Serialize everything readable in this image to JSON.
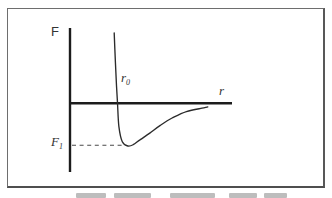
{
  "figure": {
    "y_axis_label": "F",
    "x_axis_label": "r",
    "equilibrium_label": "r",
    "equilibrium_label_sub": "0",
    "min_force_label": "F",
    "min_force_label_sub": "1"
  },
  "chart_data": {
    "type": "line",
    "title": "",
    "xlabel": "r",
    "ylabel": "F",
    "grid": false,
    "legend": false,
    "axis_numeric": false,
    "x_units": "separation r in units of r0 (no numeric scale shown)",
    "y_units": "force F in units of |F1| (no numeric scale shown)",
    "annotations": [
      {
        "label": "r0",
        "meaning": "zero crossing of force curve (equilibrium separation)",
        "x": 1.0,
        "y": 0.0
      },
      {
        "label": "F1",
        "meaning": "curve minimum marked by horizontal dashed line to F axis",
        "x": 1.22,
        "y": -1.0
      }
    ],
    "series": [
      {
        "name": "force versus separation curve",
        "points": [
          [
            0.93,
            1.63
          ],
          [
            0.955,
            0.95
          ],
          [
            0.98,
            0.4
          ],
          [
            1.0,
            0.0
          ],
          [
            1.03,
            -0.55
          ],
          [
            1.1,
            -0.9
          ],
          [
            1.22,
            -1.0
          ],
          [
            1.33,
            -0.97
          ],
          [
            1.48,
            -0.85
          ],
          [
            1.68,
            -0.7
          ],
          [
            1.9,
            -0.52
          ],
          [
            2.15,
            -0.35
          ],
          [
            2.45,
            -0.2
          ],
          [
            2.78,
            -0.12
          ],
          [
            2.9,
            -0.09
          ]
        ]
      }
    ]
  },
  "colors": {
    "ink": "#2b2b2b",
    "frame": "#6e6e6e",
    "background": "#ffffff",
    "dashed_line": "#4a4a4a"
  }
}
